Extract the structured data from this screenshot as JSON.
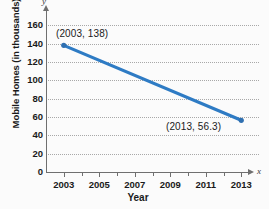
{
  "chart_data": {
    "type": "line",
    "title": "",
    "xlabel": "Year",
    "ylabel": "Mobile Homes (in thousands)",
    "xlim": [
      2002,
      2014
    ],
    "ylim": [
      0,
      170
    ],
    "grid": true,
    "legend": false,
    "axis_letters": {
      "x": "x",
      "y": "y"
    },
    "x_tick_labels": [
      "2003",
      "2005",
      "2007",
      "2009",
      "2011",
      "2013"
    ],
    "x_tick_values": [
      2003,
      2005,
      2007,
      2009,
      2011,
      2013
    ],
    "x_minor_tick_values": [
      2004,
      2006,
      2008,
      2010,
      2012
    ],
    "y_tick_labels": [
      "0",
      "20",
      "40",
      "60",
      "80",
      "100",
      "120",
      "140",
      "160"
    ],
    "y_tick_values": [
      0,
      20,
      40,
      60,
      80,
      100,
      120,
      140,
      160
    ],
    "series": [
      {
        "name": "Mobile Homes",
        "color": "#2e7bc4",
        "x": [
          2003,
          2013
        ],
        "values": [
          138,
          56.3
        ]
      }
    ],
    "annotations": [
      {
        "text": "(2003, 138)",
        "x": 2003,
        "y": 138
      },
      {
        "text": "(2013, 56.3)",
        "x": 2013,
        "y": 56.3
      }
    ],
    "colors": {
      "line": "#2e7bc4",
      "marker": "#2f6fb0",
      "gridline": "#a8a8a8",
      "axis": "#6f6f6f",
      "text": "#1a1a1a",
      "background": "#fbfbfb"
    }
  }
}
